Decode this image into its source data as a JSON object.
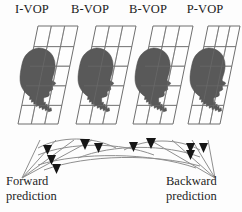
{
  "diagram": {
    "vops": [
      {
        "label": "I-VOP",
        "x": 12,
        "kind": "intra-coded"
      },
      {
        "label": "B-VOP",
        "x": 70,
        "kind": "bidirectional"
      },
      {
        "label": "B-VOP",
        "x": 128,
        "kind": "bidirectional"
      },
      {
        "label": "P-VOP",
        "x": 182,
        "kind": "predicted"
      }
    ],
    "predictions": {
      "forward_label_line1": "Forward",
      "forward_label_line2": "prediction",
      "backward_label_line1": "Backward",
      "backward_label_line2": "prediction"
    },
    "colors": {
      "background": "#fdfdfd",
      "silhouette": "#595959",
      "silhouette_edge": "#4a4a4a",
      "grid_line": "#8a8a8a",
      "plane_edge": "#6f6f6f",
      "arrow_curve": "#8f8f8f",
      "arrow_head": "#151515",
      "text": "#1b1b1b"
    },
    "geometry": {
      "plane_width": 40,
      "plane_height": 86,
      "plane_skew": 20,
      "plane_top": 26,
      "vertical_grid_lines": 3,
      "horizontal_grid_lines": 5
    }
  }
}
